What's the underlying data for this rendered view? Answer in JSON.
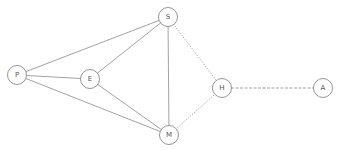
{
  "diagram": {
    "type": "network-graph",
    "nodes": [
      {
        "id": "P",
        "label": "P",
        "x": 17,
        "y": 75
      },
      {
        "id": "E",
        "label": "E",
        "x": 90,
        "y": 79
      },
      {
        "id": "S",
        "label": "S",
        "x": 168,
        "y": 17
      },
      {
        "id": "M",
        "label": "M",
        "x": 169,
        "y": 135
      },
      {
        "id": "H",
        "label": "H",
        "x": 222,
        "y": 88
      },
      {
        "id": "A",
        "label": "A",
        "x": 323,
        "y": 88
      }
    ],
    "edges": [
      {
        "from": "P",
        "to": "S",
        "style": "solid"
      },
      {
        "from": "P",
        "to": "E",
        "style": "solid"
      },
      {
        "from": "P",
        "to": "M",
        "style": "solid"
      },
      {
        "from": "E",
        "to": "S",
        "style": "solid"
      },
      {
        "from": "E",
        "to": "M",
        "style": "solid"
      },
      {
        "from": "S",
        "to": "M",
        "style": "solid"
      },
      {
        "from": "S",
        "to": "H",
        "style": "dotted"
      },
      {
        "from": "M",
        "to": "H",
        "style": "dotted"
      },
      {
        "from": "H",
        "to": "A",
        "style": "dashed"
      }
    ],
    "colors": {
      "stroke": "#8a8a8a",
      "label": "#555555",
      "background": "#ffffff"
    }
  }
}
